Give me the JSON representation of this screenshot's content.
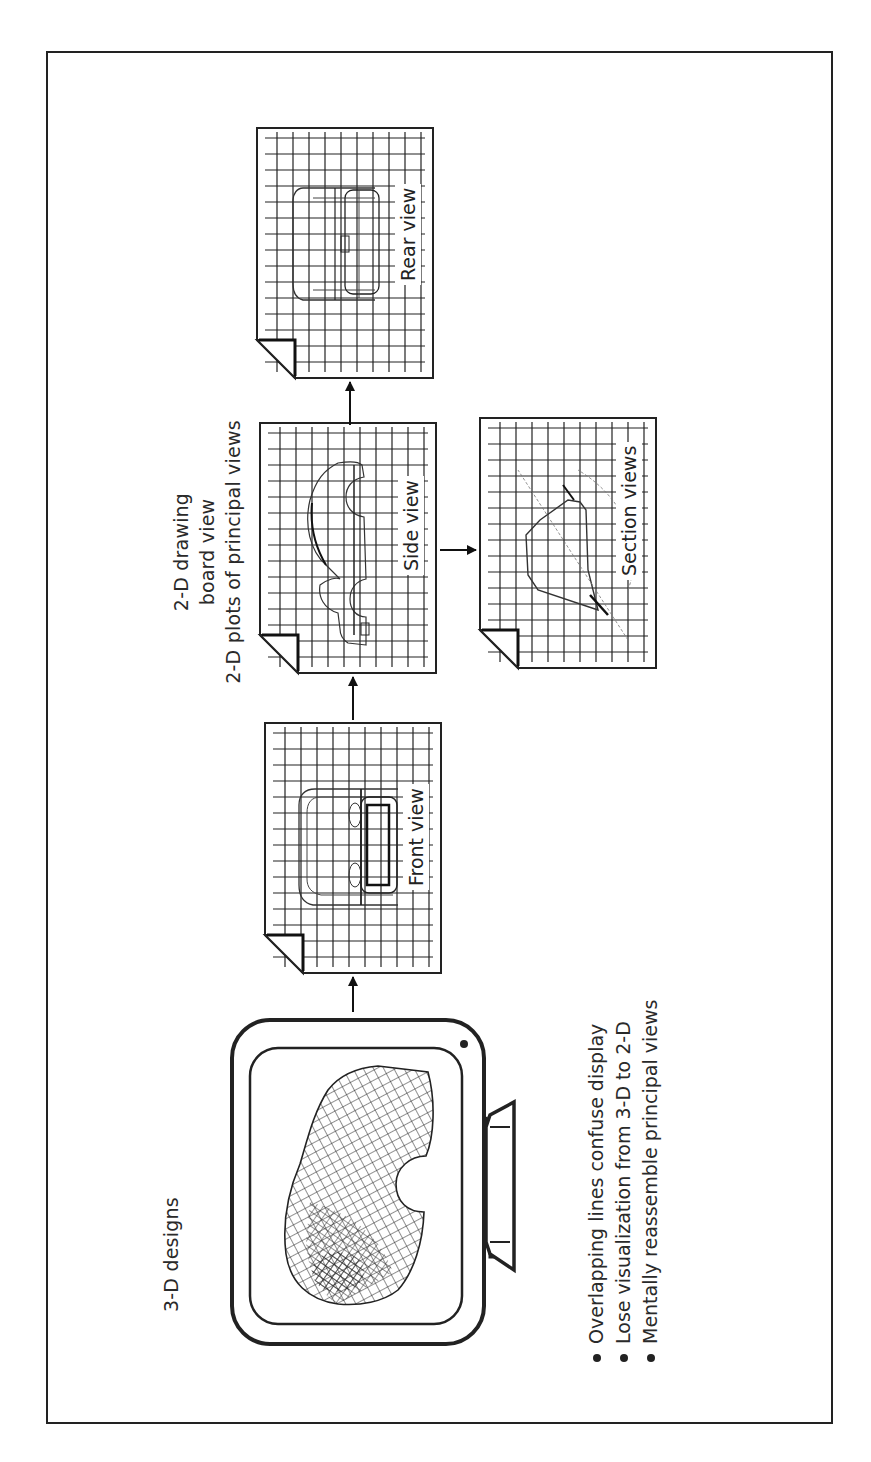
{
  "diagram": {
    "title_3d": "3-D designs",
    "board_label": {
      "line1": "2-D drawing",
      "line2": "board view",
      "line3": "2-D plots of principal views"
    },
    "sheets": [
      {
        "id": "front",
        "label": "Front view"
      },
      {
        "id": "side",
        "label": "Side view"
      },
      {
        "id": "rear",
        "label": "Rear view"
      },
      {
        "id": "section",
        "label": "Section views"
      }
    ],
    "bullets": [
      "Overlapping lines confuse display",
      "Lose visualization from 3-D to 2-D",
      "Mentally reassemble principal views"
    ],
    "flow": [
      {
        "from": "3-D designs monitor",
        "to": "Front view"
      },
      {
        "from": "Front view",
        "to": "Side view"
      },
      {
        "from": "Side view",
        "to": "Rear view"
      },
      {
        "from": "Side view",
        "to": "Section views"
      }
    ],
    "orientation": "rotated 90 degrees counter-clockwise",
    "colors": {
      "line": "#222222",
      "background": "#ffffff"
    }
  }
}
